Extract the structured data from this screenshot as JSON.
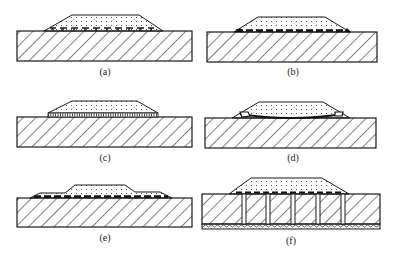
{
  "figure": {
    "panels": [
      {
        "id": "a",
        "label": "(a)",
        "interface": "bumps"
      },
      {
        "id": "b",
        "label": "(b)",
        "interface": "dashed-solder-layer"
      },
      {
        "id": "c",
        "label": "(c)",
        "interface": "fine-ladder-layer"
      },
      {
        "id": "d",
        "label": "(d)",
        "interface": "curved-solder-with-voids"
      },
      {
        "id": "e",
        "label": "(e)",
        "interface": "stepped-chip-dashed-layer"
      },
      {
        "id": "f",
        "label": "(f)",
        "interface": "through-vias-with-porous-base"
      }
    ],
    "colors": {
      "line": "#1a1a1a",
      "background": "#ffffff"
    }
  }
}
